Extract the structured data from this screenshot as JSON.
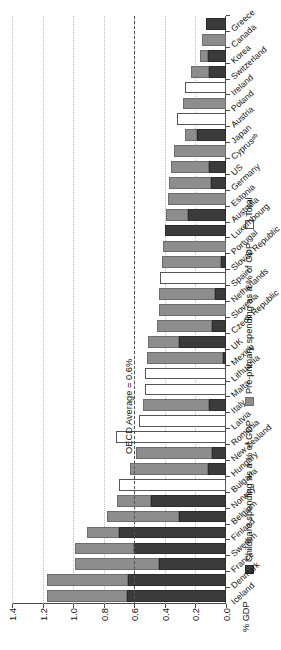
{
  "axis": {
    "value_axis_label": "% GDP",
    "ticks": [
      "1.4",
      "1.2",
      "1.0",
      "0.8",
      "0.6",
      "0.4",
      "0.2",
      "0.0"
    ]
  },
  "legend": {
    "items": [
      {
        "label": "Childcare spending as a % of GDP",
        "swatch": "dark-gray-swatch",
        "color": "#3b3b3b"
      },
      {
        "label": "Pre-primary spending as a % of GDP",
        "swatch": "medium-gray-swatch",
        "color": "#8d8d8d"
      },
      {
        "label": "Total",
        "swatch": "white-swatch",
        "color": "#ffffff"
      }
    ]
  },
  "annotation": {
    "oecd_average_label": "OECD Average = 0.6%",
    "oecd_average_value": 0.6
  },
  "chart_data": {
    "type": "bar",
    "orientation": "horizontal-stacked",
    "title": "",
    "xlabel": "",
    "ylabel": "% GDP",
    "ylim": [
      0.0,
      1.4
    ],
    "ytick_step": 0.2,
    "grid": true,
    "legend_position": "top",
    "stacked": true,
    "series": [
      {
        "name": "Childcare spending as a % of GDP",
        "color": "#3b3b3b"
      },
      {
        "name": "Pre-primary spending as a % of GDP",
        "color": "#8d8d8d"
      },
      {
        "name": "Total",
        "color": "#ffffff"
      }
    ],
    "categories": [
      "Iceland",
      "Denmark",
      "France",
      "Sweden",
      "Finland",
      "Belgium",
      "Norway",
      "Bulgaria",
      "Hungary",
      "New Zealand",
      "Romania",
      "Latvia",
      "Italy",
      "Malta",
      "Lithuania",
      "Mexico",
      "UK",
      "Czech Republic",
      "Slovenia",
      "Netherlands",
      "Spain",
      "Slovak Republic",
      "Portugal",
      "Luxembourg",
      "Australia",
      "Estonia",
      "Germany",
      "US",
      "Cyprusᵃᵇ",
      "Japan",
      "Austria",
      "Poland",
      "Ireland",
      "Switzerland",
      "Korea",
      "Canada",
      "Greece"
    ],
    "data": [
      {
        "category": "Iceland",
        "childcare": 0.65,
        "preprimary": 0.52,
        "total": null,
        "sum": 1.17
      },
      {
        "category": "Denmark",
        "childcare": 0.64,
        "preprimary": 0.53,
        "total": null,
        "sum": 1.17
      },
      {
        "category": "France",
        "childcare": 0.44,
        "preprimary": 0.55,
        "total": null,
        "sum": 0.99
      },
      {
        "category": "Sweden",
        "childcare": 0.6,
        "preprimary": 0.39,
        "total": null,
        "sum": 0.99
      },
      {
        "category": "Finland",
        "childcare": 0.7,
        "preprimary": 0.21,
        "total": null,
        "sum": 0.91
      },
      {
        "category": "Belgium",
        "childcare": 0.31,
        "preprimary": 0.47,
        "total": null,
        "sum": 0.78
      },
      {
        "category": "Norway",
        "childcare": 0.49,
        "preprimary": 0.22,
        "total": null,
        "sum": 0.71
      },
      {
        "category": "Bulgaria",
        "childcare": 0.0,
        "preprimary": 0.0,
        "total": 0.7,
        "sum": 0.7
      },
      {
        "category": "Hungary",
        "childcare": 0.12,
        "preprimary": 0.51,
        "total": null,
        "sum": 0.63
      },
      {
        "category": "New Zealand",
        "childcare": 0.09,
        "preprimary": 0.5,
        "total": null,
        "sum": 0.59
      },
      {
        "category": "Romania",
        "childcare": 0.0,
        "preprimary": 0.0,
        "total": 0.72,
        "sum": 0.72
      },
      {
        "category": "Latvia",
        "childcare": 0.0,
        "preprimary": 0.0,
        "total": 0.57,
        "sum": 0.57
      },
      {
        "category": "Italy",
        "childcare": 0.11,
        "preprimary": 0.43,
        "total": null,
        "sum": 0.54
      },
      {
        "category": "Malta",
        "childcare": 0.0,
        "preprimary": 0.0,
        "total": 0.53,
        "sum": 0.53
      },
      {
        "category": "Lithuania",
        "childcare": 0.0,
        "preprimary": 0.0,
        "total": 0.53,
        "sum": 0.53
      },
      {
        "category": "Mexico",
        "childcare": 0.02,
        "preprimary": 0.5,
        "total": null,
        "sum": 0.52
      },
      {
        "category": "UK",
        "childcare": 0.31,
        "preprimary": 0.2,
        "total": null,
        "sum": 0.51
      },
      {
        "category": "Czech Republic",
        "childcare": 0.09,
        "preprimary": 0.36,
        "total": null,
        "sum": 0.45
      },
      {
        "category": "Slovenia",
        "childcare": 0.0,
        "preprimary": 0.44,
        "total": null,
        "sum": 0.44
      },
      {
        "category": "Netherlands",
        "childcare": 0.07,
        "preprimary": 0.37,
        "total": null,
        "sum": 0.44
      },
      {
        "category": "Spain",
        "childcare": 0.0,
        "preprimary": 0.0,
        "total": 0.43,
        "sum": 0.43
      },
      {
        "category": "Slovak Republic",
        "childcare": 0.03,
        "preprimary": 0.39,
        "total": null,
        "sum": 0.42
      },
      {
        "category": "Portugal",
        "childcare": 0.0,
        "preprimary": 0.41,
        "total": null,
        "sum": 0.41
      },
      {
        "category": "Luxembourg",
        "childcare": 0.4,
        "preprimary": 0.0,
        "total": null,
        "sum": 0.4
      },
      {
        "category": "Australia",
        "childcare": 0.25,
        "preprimary": 0.14,
        "total": null,
        "sum": 0.39
      },
      {
        "category": "Estonia",
        "childcare": 0.0,
        "preprimary": 0.38,
        "total": null,
        "sum": 0.38
      },
      {
        "category": "Germany",
        "childcare": 0.1,
        "preprimary": 0.27,
        "total": null,
        "sum": 0.37
      },
      {
        "category": "US",
        "childcare": 0.11,
        "preprimary": 0.25,
        "total": null,
        "sum": 0.36
      },
      {
        "category": "Cyprusᵃᵇ",
        "childcare": 0.0,
        "preprimary": 0.34,
        "total": null,
        "sum": 0.34
      },
      {
        "category": "Japan",
        "childcare": 0.19,
        "preprimary": 0.08,
        "total": null,
        "sum": 0.27
      },
      {
        "category": "Austria",
        "childcare": 0.0,
        "preprimary": 0.0,
        "total": 0.32,
        "sum": 0.32
      },
      {
        "category": "Poland",
        "childcare": 0.0,
        "preprimary": 0.28,
        "total": null,
        "sum": 0.28
      },
      {
        "category": "Ireland",
        "childcare": 0.0,
        "preprimary": 0.0,
        "total": 0.27,
        "sum": 0.27
      },
      {
        "category": "Switzerland",
        "childcare": 0.11,
        "preprimary": 0.12,
        "total": null,
        "sum": 0.23
      },
      {
        "category": "Korea",
        "childcare": 0.12,
        "preprimary": 0.05,
        "total": null,
        "sum": 0.17
      },
      {
        "category": "Canada",
        "childcare": 0.0,
        "preprimary": 0.16,
        "total": null,
        "sum": 0.16
      },
      {
        "category": "Greece",
        "childcare": 0.13,
        "preprimary": 0.0,
        "total": null,
        "sum": 0.13
      }
    ]
  }
}
